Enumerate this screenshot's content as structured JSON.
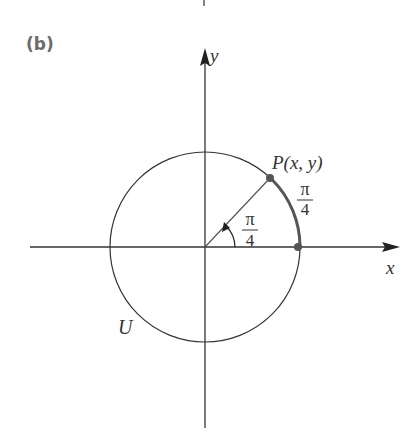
{
  "panel_label": "(b)",
  "axes": {
    "x_label": "x",
    "y_label": "y"
  },
  "circle_label": "U",
  "point": {
    "label": "P(x, y)"
  },
  "angle": {
    "numerator": "π",
    "denominator": "4"
  },
  "arc": {
    "numerator": "π",
    "denominator": "4"
  },
  "colors": {
    "line": "#333333",
    "arc": "#555555",
    "point": "#555555"
  }
}
